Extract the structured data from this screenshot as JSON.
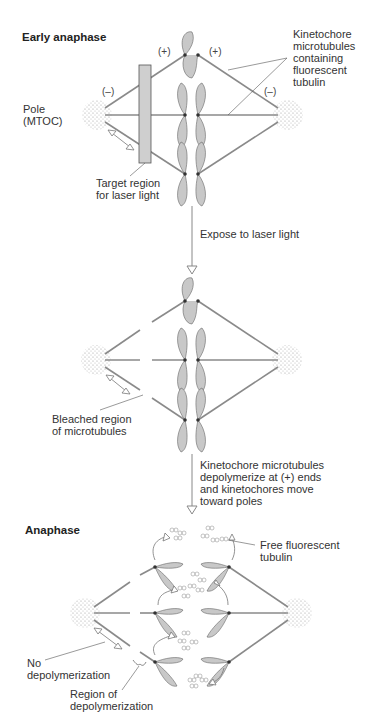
{
  "panels": {
    "early_anaphase": {
      "title": "Early anaphase",
      "pole_label": "Pole\n(MTOC)",
      "plus_left": "(+)",
      "plus_right": "(+)",
      "minus_left": "(–)",
      "minus_right": "(–)",
      "kinetochore_label": "Kinetochore\nmicrotubules\ncontaining\nfluorescent\ntubulin",
      "target_label": "Target region\nfor laser light"
    },
    "step1": {
      "arrow_label": "Expose to laser light"
    },
    "bleached": {
      "bleached_label": "Bleached region\nof microtubules"
    },
    "step2": {
      "arrow_label": "Kinetochore microtubules\ndepolymerize at (+) ends\nand kinetochores move\ntoward poles"
    },
    "anaphase": {
      "title": "Anaphase",
      "free_tubulin_label": "Free fluorescent\ntubulin",
      "no_depoly_label": "No\ndepolymerization",
      "region_depoly_label": "Region of\ndepolymerization"
    }
  },
  "colors": {
    "microtubule": "#8a8a8a",
    "chromosome_fill": "#c8c8c8",
    "chromosome_stroke": "#666666",
    "target_region": "#cfcfcf",
    "text": "#333333"
  }
}
